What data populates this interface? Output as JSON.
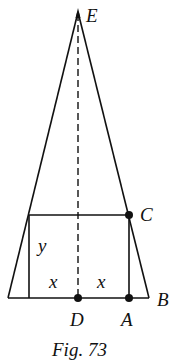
{
  "figure": {
    "caption": "Fig. 73",
    "stroke_color": "#111111",
    "background": "#ffffff"
  },
  "points": {
    "E": "E",
    "C": "C",
    "B": "B",
    "A": "A",
    "D": "D"
  },
  "labels": {
    "y": "y",
    "x_left": "x",
    "x_right": "x"
  }
}
